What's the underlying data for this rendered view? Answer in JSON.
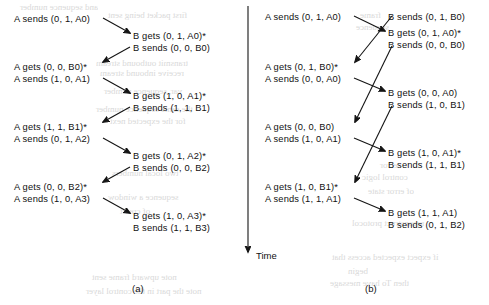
{
  "figure": {
    "time_axis_label": "Time",
    "panel_a_label": "(a)",
    "panel_b_label": "(b)"
  },
  "panel_a": {
    "caption": "(a)",
    "a_events": [
      {
        "id": "a0",
        "text": "A sends (0, 1, A0)",
        "x": 14,
        "y": 14
      },
      {
        "id": "a1",
        "text": "A gets (0, 0, B0)*",
        "x": 14,
        "y": 62
      },
      {
        "id": "a2",
        "text": "A sends (1, 0, A1)",
        "x": 14,
        "y": 74
      },
      {
        "id": "a3",
        "text": "A gets (1, 1, B1)*",
        "x": 14,
        "y": 122
      },
      {
        "id": "a4",
        "text": "A sends (0, 1, A2)",
        "x": 14,
        "y": 134
      },
      {
        "id": "a5",
        "text": "A gets (0, 0, B2)*",
        "x": 14,
        "y": 182
      },
      {
        "id": "a6",
        "text": "A sends (1, 0, A3)",
        "x": 14,
        "y": 194
      }
    ],
    "b_events": [
      {
        "id": "b0",
        "text": "B gets (0, 1, A0)*",
        "x": 133,
        "y": 31
      },
      {
        "id": "b1",
        "text": "B sends (0, 0, B0)",
        "x": 133,
        "y": 43
      },
      {
        "id": "b2",
        "text": "B gets (1, 0, A1)*",
        "x": 133,
        "y": 91
      },
      {
        "id": "b3",
        "text": "B sends (1, 1, B1)",
        "x": 133,
        "y": 103
      },
      {
        "id": "b4",
        "text": "B gets (0, 1, A2)*",
        "x": 133,
        "y": 151
      },
      {
        "id": "b5",
        "text": "B sends (0, 0, B2)",
        "x": 133,
        "y": 163
      },
      {
        "id": "b6",
        "text": "B gets (1, 0, A3)*",
        "x": 133,
        "y": 211
      },
      {
        "id": "b7",
        "text": "B sends (1, 1, B3)",
        "x": 133,
        "y": 223
      }
    ],
    "arrows": [
      {
        "id": "a-to-b-1",
        "x1": 103,
        "y1": 18,
        "x2": 130,
        "y2": 33
      },
      {
        "id": "b-to-a-1",
        "x1": 130,
        "y1": 47,
        "x2": 103,
        "y2": 62
      },
      {
        "id": "a-to-b-2",
        "x1": 103,
        "y1": 78,
        "x2": 130,
        "y2": 93
      },
      {
        "id": "b-to-a-2",
        "x1": 130,
        "y1": 107,
        "x2": 103,
        "y2": 122
      },
      {
        "id": "a-to-b-3",
        "x1": 103,
        "y1": 138,
        "x2": 130,
        "y2": 153
      },
      {
        "id": "b-to-a-3",
        "x1": 130,
        "y1": 167,
        "x2": 103,
        "y2": 182
      },
      {
        "id": "a-to-b-4",
        "x1": 103,
        "y1": 198,
        "x2": 130,
        "y2": 213
      }
    ]
  },
  "panel_b": {
    "caption": "(b)",
    "a_events": [
      {
        "id": "a0",
        "text": "A sends (0, 1, A0)",
        "x": 265,
        "y": 12
      },
      {
        "id": "a1",
        "text": "A gets (0, 1, B0)*",
        "x": 265,
        "y": 62
      },
      {
        "id": "a2",
        "text": "A sends (0, 0, A0)",
        "x": 265,
        "y": 74
      },
      {
        "id": "a3",
        "text": "A gets (0, 0, B0)",
        "x": 265,
        "y": 122
      },
      {
        "id": "a4",
        "text": "A sends (1, 0, A1)",
        "x": 265,
        "y": 134
      },
      {
        "id": "a5",
        "text": "A gets (1, 0, B1)*",
        "x": 265,
        "y": 182
      },
      {
        "id": "a6",
        "text": "A sends (1, 1, A1)",
        "x": 265,
        "y": 194
      }
    ],
    "b_events": [
      {
        "id": "b0",
        "text": "B sends (0, 1, B0)",
        "x": 388,
        "y": 12
      },
      {
        "id": "b1",
        "text": "B gets (0, 1, A0)*",
        "x": 388,
        "y": 28
      },
      {
        "id": "b2",
        "text": "B sends (0, 0, B0)",
        "x": 388,
        "y": 40
      },
      {
        "id": "b3",
        "text": "B gets (0, 0, A0)",
        "x": 388,
        "y": 88
      },
      {
        "id": "b4",
        "text": "B sends (1, 0, B1)",
        "x": 388,
        "y": 100
      },
      {
        "id": "b5",
        "text": "B gets (1, 0, A1)*",
        "x": 388,
        "y": 148
      },
      {
        "id": "b6",
        "text": "B sends (1, 1, B1)",
        "x": 388,
        "y": 160
      },
      {
        "id": "b7",
        "text": "B gets (1, 1, A1)",
        "x": 388,
        "y": 208
      },
      {
        "id": "b8",
        "text": "B sends (0, 1, B2)",
        "x": 388,
        "y": 220
      }
    ],
    "arrows": [
      {
        "id": "a-to-b-1",
        "x1": 354,
        "y1": 16,
        "x2": 385,
        "y2": 31
      },
      {
        "id": "b-to-a-1",
        "x1": 392,
        "y1": 16,
        "x2": 355,
        "y2": 62
      },
      {
        "id": "a-to-b-2",
        "x1": 354,
        "y1": 78,
        "x2": 385,
        "y2": 91
      },
      {
        "id": "b-to-a-2",
        "x1": 392,
        "y1": 46,
        "x2": 355,
        "y2": 122
      },
      {
        "id": "a-to-b-3",
        "x1": 354,
        "y1": 138,
        "x2": 385,
        "y2": 151
      },
      {
        "id": "b-to-a-3",
        "x1": 392,
        "y1": 106,
        "x2": 355,
        "y2": 182
      },
      {
        "id": "a-to-b-4",
        "x1": 354,
        "y1": 198,
        "x2": 385,
        "y2": 211
      }
    ]
  },
  "time_axis": {
    "label": "Time",
    "x": 248,
    "y_top": 6,
    "y_bottom": 252,
    "label_x": 256,
    "label_y": 250
  },
  "bleed_text": [
    {
      "text": "and sequence number",
      "x": 20,
      "y": 2
    },
    {
      "text": "first packet being sent",
      "x": 108,
      "y": 10
    },
    {
      "text": "transmit outbound  stream",
      "x": 96,
      "y": 58
    },
    {
      "text": "receive inbound  stream",
      "x": 100,
      "y": 68
    },
    {
      "text": "var, sequence number",
      "x": 104,
      "y": 86
    },
    {
      "text": "the same sequence number",
      "x": 96,
      "y": 104
    },
    {
      "text": "for the expected next",
      "x": 110,
      "y": 116
    },
    {
      "text": "two local  numbers",
      "x": 112,
      "y": 168
    },
    {
      "text": "sequence a window",
      "x": 108,
      "y": 192
    },
    {
      "text": "of credit",
      "x": 120,
      "y": 206
    },
    {
      "text": "note upward  frame sent",
      "x": 92,
      "y": 272
    },
    {
      "text": "note the part  in the control layer",
      "x": 86,
      "y": 286
    },
    {
      "text": "if expect  expected  access that",
      "x": 332,
      "y": 252
    },
    {
      "text": "begin",
      "x": 348,
      "y": 266
    },
    {
      "text": "then  To have  message",
      "x": 330,
      "y": 278
    },
    {
      "text": "error",
      "x": 380,
      "y": 160
    },
    {
      "text": "control logic",
      "x": 362,
      "y": 172
    },
    {
      "text": "of  error  state",
      "x": 368,
      "y": 186
    },
    {
      "text": "reconstruct  protocol",
      "x": 352,
      "y": 218
    },
    {
      "text": "frame",
      "x": 360,
      "y": 10
    },
    {
      "text": "sequence",
      "x": 356,
      "y": 22
    }
  ]
}
